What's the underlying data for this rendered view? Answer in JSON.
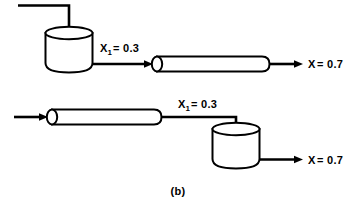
{
  "figure": {
    "caption": "(b)",
    "background_color": "#ffffff",
    "line_color": "#000000"
  },
  "diagram": {
    "type": "process-flow",
    "rows": [
      {
        "id": "top-row",
        "order": [
          "feed-line",
          "tank",
          "pipe"
        ],
        "equipment": [
          {
            "id": "tank-top",
            "kind": "stirred-tank",
            "shape": "cylinder"
          },
          {
            "id": "pipe-top",
            "kind": "tubular-reactor",
            "shape": "horizontal-cylinder"
          }
        ],
        "streams": [
          {
            "id": "feed-top",
            "label": "",
            "from": "inlet",
            "to": "tank-top"
          },
          {
            "id": "inter-top",
            "label_main": "X",
            "label_sub": "1",
            "label_value": " = 0.3",
            "label_full": "X1 = 0.3",
            "from": "tank-top",
            "to": "pipe-top"
          },
          {
            "id": "product-top",
            "label_main": "X",
            "label_sub": "",
            "label_value": " = 0.7",
            "label_full": "X = 0.7",
            "from": "pipe-top",
            "to": "outlet"
          }
        ]
      },
      {
        "id": "bottom-row",
        "order": [
          "feed-line",
          "pipe",
          "tank"
        ],
        "equipment": [
          {
            "id": "pipe-bottom",
            "kind": "tubular-reactor",
            "shape": "horizontal-cylinder"
          },
          {
            "id": "tank-bottom",
            "kind": "stirred-tank",
            "shape": "cylinder"
          }
        ],
        "streams": [
          {
            "id": "feed-bottom",
            "label": "",
            "from": "inlet",
            "to": "pipe-bottom"
          },
          {
            "id": "inter-bottom",
            "label_main": "X",
            "label_sub": "1",
            "label_value": " = 0.3",
            "label_full": "X1 = 0.3",
            "from": "pipe-bottom",
            "to": "tank-bottom"
          },
          {
            "id": "product-bottom",
            "label_main": "X",
            "label_sub": "",
            "label_value": " = 0.7",
            "label_full": "X = 0.7",
            "from": "tank-bottom",
            "to": "outlet"
          }
        ]
      }
    ]
  },
  "labels": {
    "top_intermediate": {
      "symbol": "X",
      "subscript": "1",
      "equals_value": "= 0.3"
    },
    "top_product": {
      "symbol": "X",
      "subscript": "",
      "equals_value": "= 0.7"
    },
    "bottom_intermediate": {
      "symbol": "X",
      "subscript": "1",
      "equals_value": "= 0.3"
    },
    "bottom_product": {
      "symbol": "X",
      "subscript": "",
      "equals_value": "= 0.7"
    }
  }
}
